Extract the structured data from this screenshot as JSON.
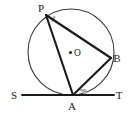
{
  "figure": {
    "type": "circle-geometry-diagram",
    "background_color": "#ffffff",
    "stroke_color": "#1a1a1a",
    "circle_stroke_color": "#3a3a3a",
    "angle_mark_color": "#9a9a9a",
    "circle": {
      "center_label": "O",
      "center_x": 71,
      "center_y": 52,
      "radius": 43
    },
    "points": [
      {
        "label": "P",
        "x": 46,
        "y": 15,
        "label_x": 41,
        "label_y": 12
      },
      {
        "label": "B",
        "x": 111,
        "y": 58,
        "label_x": 115,
        "label_y": 61
      },
      {
        "label": "A",
        "x": 73,
        "y": 95,
        "label_x": 69,
        "label_y": 110
      },
      {
        "label": "O",
        "x": 71,
        "y": 52,
        "label_x": 75,
        "label_y": 56
      }
    ],
    "tangent_line": {
      "start_label": "S",
      "end_label": "T",
      "start_label_x": 12,
      "start_label_y": 97,
      "end_label_x": 116,
      "end_label_y": 97,
      "x1": 22,
      "x2": 114,
      "y": 95
    },
    "segments": [
      {
        "name": "PA",
        "from": "P",
        "to": "A"
      },
      {
        "name": "PB",
        "from": "P",
        "to": "B"
      },
      {
        "name": "AB",
        "from": "A",
        "to": "B"
      },
      {
        "name": "ST",
        "from": "S",
        "to": "T"
      }
    ],
    "angle_marks": [
      {
        "name": "angle-APB",
        "at": "P"
      },
      {
        "name": "angle-BAT",
        "at": "A"
      }
    ]
  }
}
